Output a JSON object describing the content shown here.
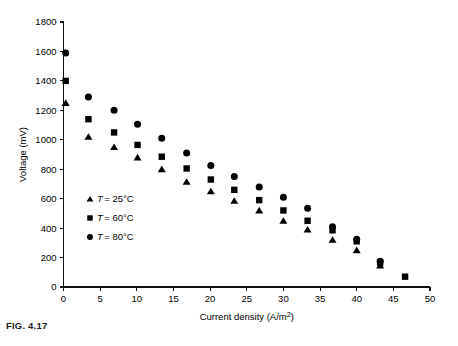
{
  "figure": {
    "caption": "FIG. 4.17"
  },
  "chart_data": {
    "type": "scatter",
    "title": "",
    "xlabel": "Current density (A/m2)",
    "xlabel_base": "Current density (A/m",
    "xlabel_sup": "2",
    "xlabel_tail": ")",
    "ylabel": "Voltage (mV)",
    "xlim": [
      0,
      50
    ],
    "ylim": [
      0,
      1800
    ],
    "xticks": [
      0,
      5,
      10,
      15,
      20,
      25,
      30,
      35,
      40,
      45,
      50
    ],
    "yticks": [
      0,
      200,
      400,
      600,
      800,
      1000,
      1200,
      1400,
      1600,
      1800
    ],
    "grid": false,
    "legend_position": "inside-lower-left",
    "series": [
      {
        "name": "T = 25°C",
        "label_prefix": "T",
        "label_value": "= 25°C",
        "marker": "triangle",
        "color": "#000000",
        "x": [
          0.3,
          3.4,
          6.9,
          10.1,
          13.4,
          16.8,
          20.1,
          23.3,
          26.7,
          30.0,
          33.3,
          36.7,
          40.0,
          43.2
        ],
        "y": [
          1250,
          1020,
          950,
          880,
          800,
          715,
          650,
          585,
          520,
          450,
          390,
          320,
          250,
          145
        ]
      },
      {
        "name": "T = 60°C",
        "label_prefix": "T",
        "label_value": "= 60°C",
        "marker": "square",
        "color": "#000000",
        "x": [
          0.3,
          3.4,
          6.9,
          10.1,
          13.4,
          16.8,
          20.1,
          23.3,
          26.7,
          30.0,
          33.3,
          36.7,
          40.0,
          43.2,
          46.6
        ],
        "y": [
          1400,
          1140,
          1050,
          965,
          885,
          805,
          730,
          660,
          590,
          520,
          450,
          385,
          310,
          165,
          70
        ]
      },
      {
        "name": "T = 80°C",
        "label_prefix": "T",
        "label_value": "= 80°C",
        "marker": "circle",
        "color": "#000000",
        "x": [
          0.3,
          3.4,
          6.9,
          10.1,
          13.4,
          16.8,
          20.1,
          23.3,
          26.7,
          30.0,
          33.3,
          36.7,
          40.0,
          43.2
        ],
        "y": [
          1590,
          1290,
          1200,
          1105,
          1010,
          910,
          825,
          750,
          680,
          610,
          535,
          410,
          325,
          175
        ]
      }
    ]
  }
}
